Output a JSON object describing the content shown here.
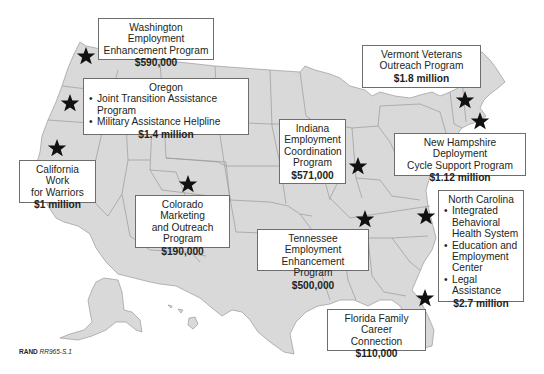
{
  "map": {
    "type": "US state map with program locations",
    "land_color": "#d9d9d9",
    "border_color": "#9a9a9a",
    "marker_color": "#111111",
    "marker_icon": "star-icon"
  },
  "callouts": [
    {
      "id": "washington",
      "title_lines": [
        "Washington Employment",
        "Enhancement Program"
      ],
      "items": [],
      "amount": "$590,000"
    },
    {
      "id": "oregon",
      "title_lines": [
        "Oregon"
      ],
      "items": [
        "Joint Transition Assistance Program",
        "Military Assistance Helpline"
      ],
      "amount": "$1.4 million"
    },
    {
      "id": "california",
      "title_lines": [
        "California Work",
        "for Warriors"
      ],
      "items": [],
      "amount": "$1 million"
    },
    {
      "id": "colorado",
      "title_lines": [
        "Colorado Marketing",
        "and Outreach",
        "Program"
      ],
      "items": [],
      "amount": "$190,000"
    },
    {
      "id": "indiana",
      "title_lines": [
        "Indiana",
        "Employment",
        "Coordination",
        "Program"
      ],
      "items": [],
      "amount": "$571,000"
    },
    {
      "id": "vermont",
      "title_lines": [
        "Vermont Veterans",
        "Outreach Program"
      ],
      "items": [],
      "amount": "$1.8 million"
    },
    {
      "id": "new-hampshire",
      "title_lines": [
        "New Hampshire Deployment",
        "Cycle Support Program"
      ],
      "items": [],
      "amount": "$1.12 million"
    },
    {
      "id": "north-carolina",
      "title_lines": [
        "North Carolina"
      ],
      "items": [
        "Integrated Behavioral Health System",
        "Education and Employment Center",
        "Legal Assistance"
      ],
      "amount": "$2.7 million"
    },
    {
      "id": "tennessee",
      "title_lines": [
        "Tennessee Employment",
        "Enhancement Program"
      ],
      "items": [],
      "amount": "$500,000"
    },
    {
      "id": "florida",
      "title_lines": [
        "Florida Family Career",
        "Connection"
      ],
      "items": [],
      "amount": "$110,000"
    }
  ],
  "text": {
    "wa_l1": "Washington Employment",
    "wa_l2": "Enhancement Program",
    "wa_amt": "$590,000",
    "or_title": "Oregon",
    "or_i1": "Joint Transition Assistance Program",
    "or_i2": "Military Assistance Helpline",
    "or_amt": "$1.4 million",
    "ca_l1": "California Work",
    "ca_l2": "for Warriors",
    "ca_amt": "$1 million",
    "co_l1": "Colorado Marketing",
    "co_l2": "and Outreach",
    "co_l3": "Program",
    "co_amt": "$190,000",
    "in_l1": "Indiana",
    "in_l2": "Employment",
    "in_l3": "Coordination",
    "in_l4": "Program",
    "in_amt": "$571,000",
    "vt_l1": "Vermont Veterans",
    "vt_l2": "Outreach Program",
    "vt_amt": "$1.8 million",
    "nh_l1": "New Hampshire Deployment",
    "nh_l2": "Cycle Support Program",
    "nh_amt": "$1.12 million",
    "nc_title": "North Carolina",
    "nc_i1": "Integrated Behavioral Health System",
    "nc_i2": "Education and Employment Center",
    "nc_i3": "Legal Assistance",
    "nc_amt": "$2.7 million",
    "tn_l1": "Tennessee Employment",
    "tn_l2": "Enhancement Program",
    "tn_amt": "$500,000",
    "fl_l1": "Florida Family Career",
    "fl_l2": "Connection",
    "fl_amt": "$110,000"
  },
  "caption": {
    "brand": "RAND",
    "code": "RR965-S.1"
  }
}
